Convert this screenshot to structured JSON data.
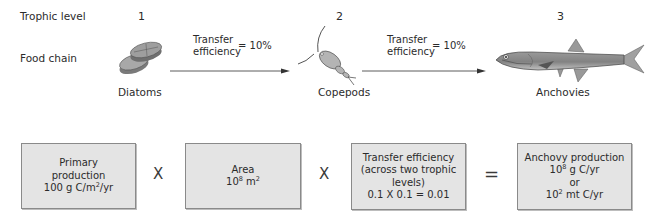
{
  "rows": {
    "trophic_level_label": "Trophic level",
    "food_chain_label": "Food chain"
  },
  "levels": [
    {
      "number": "1",
      "organism": "Diatoms",
      "icon": "diatom-icon"
    },
    {
      "number": "2",
      "organism": "Copepods",
      "icon": "copepod-icon"
    },
    {
      "number": "3",
      "organism": "Anchovies",
      "icon": "anchovy-icon"
    }
  ],
  "transfers": [
    {
      "line1": "Transfer",
      "line2": "efficiency",
      "value": "= 10%"
    },
    {
      "line1": "Transfer",
      "line2": "efficiency",
      "value": "= 10%"
    }
  ],
  "equation": {
    "primary": {
      "line1": "Primary",
      "line2": "production",
      "line3_pre": "100 g C/m",
      "line3_sup": "2",
      "line3_post": "/yr"
    },
    "area": {
      "line1": "Area",
      "line2_pre": "10",
      "line2_sup": "8",
      "line2_post": " m",
      "line2_sup2": "2"
    },
    "transfer": {
      "line1": "Transfer efficiency",
      "line2": "(across two trophic",
      "line3": "levels)",
      "line4": "0.1 X 0.1 = 0.01"
    },
    "result": {
      "line1": "Anchovy production",
      "line2_pre": "10",
      "line2_sup": "8",
      "line2_post": " g C/yr",
      "line3": "or",
      "line4_pre": "10",
      "line4_sup": "2",
      "line4_post": " mt C/yr"
    },
    "op_times": "X",
    "op_equals": "="
  },
  "colors": {
    "box_fill": "#e4e4e4",
    "box_border": "#8a8a8a",
    "organism_gray": "#8c8c8c",
    "text": "#2b2b2b"
  }
}
